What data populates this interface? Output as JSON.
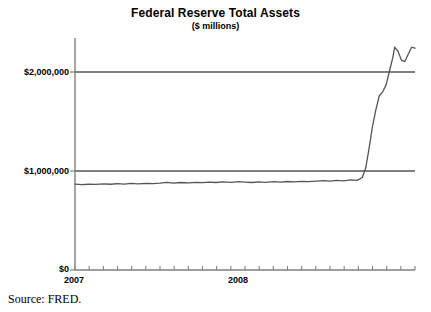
{
  "chart_data": {
    "type": "line",
    "title": "Federal Reserve Total Assets",
    "subtitle": "($ millions)",
    "xlabel": "",
    "ylabel": "",
    "ylim": [
      0,
      2350000
    ],
    "xlim": [
      2007.0,
      2009.0
    ],
    "grid": true,
    "legend": null,
    "ytick_labels": [
      "$2,000,000",
      "$1,000,000",
      "$0"
    ],
    "ytick_values": [
      2000000,
      1000000,
      0
    ],
    "xtick_labels": [
      "2007",
      "2008"
    ],
    "xtick_values": [
      2007.0,
      2008.0
    ],
    "minor_xticks_per_year": 12,
    "line_color": "#555555",
    "gridline_color": "#000000",
    "axis_color": "#808080",
    "source": "Source: FRED.",
    "series": [
      {
        "name": "Federal Reserve Total Assets",
        "x": [
          2007.0,
          2007.04,
          2007.08,
          2007.12,
          2007.17,
          2007.21,
          2007.25,
          2007.29,
          2007.33,
          2007.37,
          2007.42,
          2007.46,
          2007.5,
          2007.54,
          2007.58,
          2007.62,
          2007.67,
          2007.71,
          2007.75,
          2007.79,
          2007.83,
          2007.87,
          2007.92,
          2007.96,
          2008.0,
          2008.04,
          2008.08,
          2008.12,
          2008.17,
          2008.21,
          2008.25,
          2008.29,
          2008.33,
          2008.37,
          2008.42,
          2008.46,
          2008.5,
          2008.54,
          2008.58,
          2008.62,
          2008.66,
          2008.69,
          2008.71,
          2008.73,
          2008.75,
          2008.77,
          2008.79,
          2008.81,
          2008.83,
          2008.85,
          2008.87,
          2008.88,
          2008.9,
          2008.92,
          2008.94,
          2008.96,
          2008.98,
          2009.0
        ],
        "y": [
          868000,
          862000,
          866000,
          864000,
          870000,
          866000,
          872000,
          868000,
          874000,
          870000,
          876000,
          872000,
          878000,
          886000,
          878000,
          884000,
          880000,
          886000,
          882000,
          888000,
          884000,
          890000,
          886000,
          892000,
          888000,
          884000,
          890000,
          886000,
          892000,
          888000,
          894000,
          890000,
          896000,
          892000,
          898000,
          902000,
          898000,
          906000,
          900000,
          910000,
          905000,
          935000,
          1030000,
          1230000,
          1450000,
          1620000,
          1760000,
          1800000,
          1870000,
          2010000,
          2150000,
          2250000,
          2210000,
          2120000,
          2105000,
          2180000,
          2250000,
          2240000
        ]
      }
    ]
  }
}
